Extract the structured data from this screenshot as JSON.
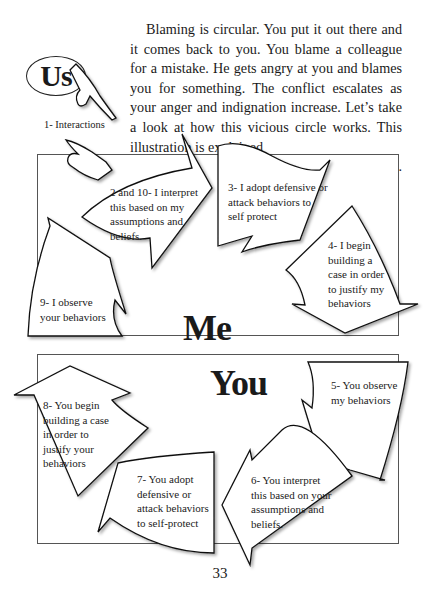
{
  "intro": {
    "text": "Blaming is circular. You put it out there and it comes back to you. You blame a colleague for a mistake. He gets angry at you and blames you for something. The conflict escalates as your anger and indignation increase. Let’s take a look at how this vicious circle works. This illustration is explained",
    "last_line": "on the next page."
  },
  "us_label": "Us",
  "interactions_caption": "1- Interactions",
  "me_panel": {
    "title": "Me",
    "steps": [
      {
        "id": "2",
        "text": "2 and 10- I interpret this based on my assumptions and beliefs."
      },
      {
        "id": "3",
        "text": "3- I adopt defensive or attack behaviors to self protect"
      },
      {
        "id": "4",
        "text": "4- I begin building a case in order to justify my behaviors"
      },
      {
        "id": "9",
        "text": "9- I observe your behaviors"
      }
    ]
  },
  "you_panel": {
    "title": "You",
    "steps": [
      {
        "id": "5",
        "text": "5- You observe my behaviors"
      },
      {
        "id": "6",
        "text": "6- You interpret this based on your assumptions and beliefs."
      },
      {
        "id": "7",
        "text": "7- You adopt defensive or attack behaviors to self-protect"
      },
      {
        "id": "8",
        "text": "8- You begin building a case in order to justify your behaviors"
      }
    ]
  },
  "page_number": "33"
}
